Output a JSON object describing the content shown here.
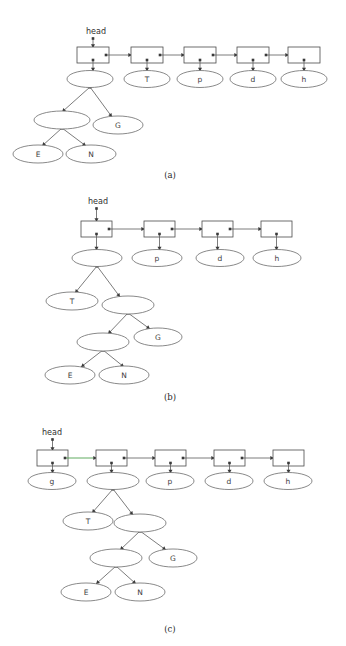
{
  "figure": {
    "background_color": "#ffffff",
    "line_color": "#5a5a5a",
    "highlight_color": "#4ea24e",
    "text_color": "#3d3d3d"
  },
  "panels": [
    {
      "id": "a",
      "caption": "(a)",
      "head_label": "head",
      "caption_x": 170,
      "caption_y": 178,
      "head_x": 96,
      "head_y": 34,
      "list_y": 54,
      "boxes": [
        {
          "x": 77,
          "y": 47,
          "w": 32,
          "h": 16
        },
        {
          "x": 131,
          "y": 47,
          "w": 32,
          "h": 16
        },
        {
          "x": 184,
          "y": 47,
          "w": 32,
          "h": 16
        },
        {
          "x": 237,
          "y": 47,
          "w": 32,
          "h": 16
        },
        {
          "x": 288,
          "y": 47,
          "w": 32,
          "h": 16
        }
      ],
      "ellipses": [
        {
          "cx": 90,
          "cy": 79,
          "rx": 23,
          "ry": 8.5,
          "label": ""
        },
        {
          "cx": 147,
          "cy": 79,
          "rx": 23,
          "ry": 8.5,
          "label": "T"
        },
        {
          "cx": 200,
          "cy": 79,
          "rx": 23,
          "ry": 8.5,
          "label": "p"
        },
        {
          "cx": 253,
          "cy": 79,
          "rx": 23,
          "ry": 8.5,
          "label": "d"
        },
        {
          "cx": 304,
          "cy": 79,
          "rx": 23,
          "ry": 8.5,
          "label": "h"
        },
        {
          "cx": 62,
          "cy": 120,
          "rx": 28,
          "ry": 9,
          "label": ""
        },
        {
          "cx": 118,
          "cy": 125,
          "rx": 25,
          "ry": 9,
          "label": "G"
        },
        {
          "cx": 38,
          "cy": 154,
          "rx": 25,
          "ry": 9,
          "label": "E"
        },
        {
          "cx": 91,
          "cy": 154,
          "rx": 25,
          "ry": 9,
          "label": "N"
        }
      ],
      "tree_edges": [
        {
          "x1": 90,
          "y1": 87,
          "x2": 62,
          "y2": 112
        },
        {
          "x1": 90,
          "y1": 87,
          "x2": 112,
          "y2": 117
        },
        {
          "x1": 62,
          "y1": 128,
          "x2": 42,
          "y2": 146
        },
        {
          "x1": 62,
          "y1": 128,
          "x2": 86,
          "y2": 146
        }
      ]
    },
    {
      "id": "b",
      "caption": "(b)",
      "head_label": "head",
      "caption_x": 170,
      "caption_y": 400,
      "head_x": 98,
      "head_y": 204,
      "list_y": 228,
      "boxes": [
        {
          "x": 81,
          "y": 221,
          "w": 31,
          "h": 16
        },
        {
          "x": 144,
          "y": 221,
          "w": 31,
          "h": 16
        },
        {
          "x": 202,
          "y": 221,
          "w": 31,
          "h": 16
        },
        {
          "x": 261,
          "y": 221,
          "w": 31,
          "h": 16
        }
      ],
      "ellipses": [
        {
          "cx": 97,
          "cy": 258,
          "rx": 25,
          "ry": 8.5,
          "label": ""
        },
        {
          "cx": 157,
          "cy": 258,
          "rx": 25,
          "ry": 8.5,
          "label": "p"
        },
        {
          "cx": 220,
          "cy": 258,
          "rx": 24,
          "ry": 8.5,
          "label": "d"
        },
        {
          "cx": 277,
          "cy": 258,
          "rx": 24,
          "ry": 8.5,
          "label": "h"
        },
        {
          "cx": 72,
          "cy": 301,
          "rx": 26,
          "ry": 9,
          "label": "T"
        },
        {
          "cx": 128,
          "cy": 305,
          "rx": 26,
          "ry": 9,
          "label": ""
        },
        {
          "cx": 103,
          "cy": 342,
          "rx": 26,
          "ry": 9,
          "label": ""
        },
        {
          "cx": 158,
          "cy": 337,
          "rx": 24,
          "ry": 9,
          "label": "G"
        },
        {
          "cx": 70,
          "cy": 375,
          "rx": 25,
          "ry": 9,
          "label": "E"
        },
        {
          "cx": 124,
          "cy": 375,
          "rx": 25,
          "ry": 9,
          "label": "N"
        }
      ],
      "tree_edges": [
        {
          "x1": 97,
          "y1": 266,
          "x2": 75,
          "y2": 293
        },
        {
          "x1": 97,
          "y1": 266,
          "x2": 120,
          "y2": 297
        },
        {
          "x1": 128,
          "y1": 313,
          "x2": 108,
          "y2": 334
        },
        {
          "x1": 128,
          "y1": 313,
          "x2": 150,
          "y2": 329
        },
        {
          "x1": 103,
          "y1": 350,
          "x2": 81,
          "y2": 367
        },
        {
          "x1": 103,
          "y1": 350,
          "x2": 124,
          "y2": 367
        }
      ]
    },
    {
      "id": "c",
      "caption": "(c)",
      "head_label": "head",
      "caption_x": 170,
      "caption_y": 632,
      "head_x": 52,
      "head_y": 435,
      "list_y": 457,
      "boxes": [
        {
          "x": 37,
          "y": 450,
          "w": 31,
          "h": 16
        },
        {
          "x": 96,
          "y": 450,
          "w": 31,
          "h": 16
        },
        {
          "x": 155,
          "y": 450,
          "w": 31,
          "h": 16
        },
        {
          "x": 214,
          "y": 450,
          "w": 31,
          "h": 16
        },
        {
          "x": 273,
          "y": 450,
          "w": 31,
          "h": 16
        }
      ],
      "ellipses": [
        {
          "cx": 52,
          "cy": 481,
          "rx": 24,
          "ry": 8.5,
          "label": "g"
        },
        {
          "cx": 113,
          "cy": 481,
          "rx": 26,
          "ry": 8.5,
          "label": ""
        },
        {
          "cx": 170,
          "cy": 481,
          "rx": 24,
          "ry": 8.5,
          "label": "p"
        },
        {
          "cx": 229,
          "cy": 481,
          "rx": 24,
          "ry": 8.5,
          "label": "d"
        },
        {
          "cx": 288,
          "cy": 481,
          "rx": 24,
          "ry": 8.5,
          "label": "h"
        },
        {
          "cx": 88,
          "cy": 521,
          "rx": 25,
          "ry": 9,
          "label": "T"
        },
        {
          "cx": 140,
          "cy": 523,
          "rx": 26,
          "ry": 9,
          "label": ""
        },
        {
          "cx": 116,
          "cy": 558,
          "rx": 26,
          "ry": 9,
          "label": ""
        },
        {
          "cx": 173,
          "cy": 558,
          "rx": 24,
          "ry": 9,
          "label": "G"
        },
        {
          "cx": 86,
          "cy": 592,
          "rx": 25,
          "ry": 9,
          "label": "E"
        },
        {
          "cx": 140,
          "cy": 592,
          "rx": 25,
          "ry": 9,
          "label": "N"
        }
      ],
      "tree_edges": [
        {
          "x1": 113,
          "y1": 489,
          "x2": 92,
          "y2": 513
        },
        {
          "x1": 113,
          "y1": 489,
          "x2": 133,
          "y2": 515
        },
        {
          "x1": 140,
          "y1": 531,
          "x2": 120,
          "y2": 550
        },
        {
          "x1": 140,
          "y1": 531,
          "x2": 166,
          "y2": 550
        },
        {
          "x1": 116,
          "y1": 566,
          "x2": 96,
          "y2": 584
        },
        {
          "x1": 116,
          "y1": 566,
          "x2": 136,
          "y2": 584
        }
      ],
      "highlighted_link_index": 0
    }
  ]
}
